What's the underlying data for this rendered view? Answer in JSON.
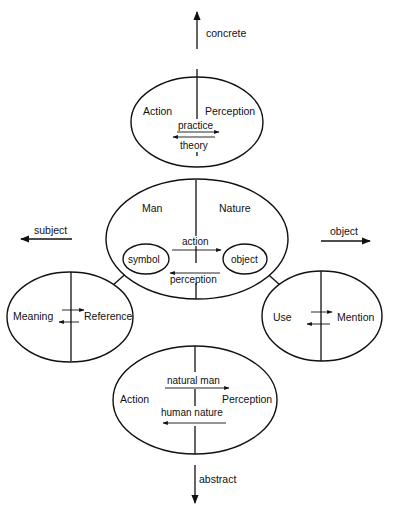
{
  "axes": {
    "up": "concrete",
    "down": "abstract",
    "left": "subject",
    "right": "object"
  },
  "top_ellipse": {
    "left": "Action",
    "right": "Perception",
    "arrow_right": "practice",
    "arrow_left": "theory"
  },
  "center_ellipse": {
    "left": "Man",
    "right": "Nature",
    "arrow_right": "action",
    "arrow_left": "perception",
    "inner_left": "symbol",
    "inner_right": "object"
  },
  "left_ellipse": {
    "left": "Meaning",
    "right": "Reference"
  },
  "right_ellipse": {
    "left": "Use",
    "right": "Mention"
  },
  "bottom_ellipse": {
    "left": "Action",
    "right": "Perception",
    "arrow_right": "natural man",
    "arrow_left": "human nature"
  },
  "colors": {
    "ink": "#111111",
    "background": "#ffffff"
  }
}
